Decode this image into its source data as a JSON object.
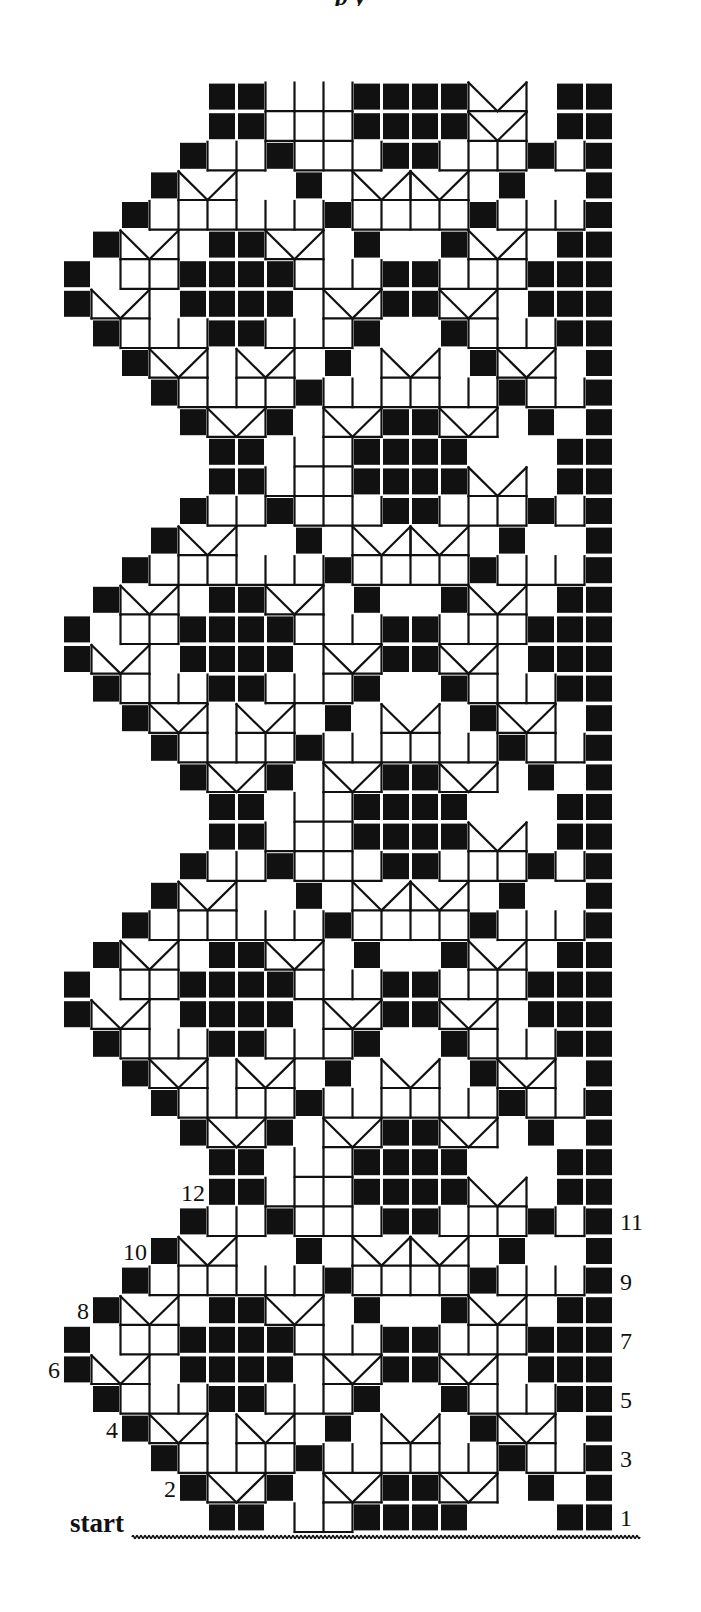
{
  "title_fragment": "p y",
  "chart": {
    "type": "filet-crochet-chart",
    "columns": 19,
    "rows": 49,
    "repeat_rows": 12,
    "colors": {
      "block": "#111111",
      "line": "#111111",
      "background": "#ffffff"
    },
    "motif": [
      {
        "row": 1,
        "blocks": [
          5,
          6,
          10,
          11,
          12,
          13,
          17,
          18
        ],
        "lacets": [],
        "bars": [
          [
            8,
            9
          ]
        ]
      },
      {
        "row": 2,
        "blocks": [
          4,
          7,
          11,
          12,
          16,
          18
        ],
        "lacets": [
          5,
          9,
          13
        ],
        "bars": []
      },
      {
        "row": 3,
        "blocks": [
          3,
          8,
          15,
          18
        ],
        "lacets": [],
        "bars": [
          [
            4,
            7
          ],
          [
            9,
            14
          ],
          [
            16,
            17
          ]
        ]
      },
      {
        "row": 4,
        "blocks": [
          2,
          9,
          14,
          18
        ],
        "lacets": [
          3,
          6,
          11,
          15
        ],
        "bars": []
      },
      {
        "row": 5,
        "blocks": [
          1,
          5,
          6,
          10,
          13,
          17,
          18
        ],
        "lacets": [],
        "bars": [
          [
            2,
            4
          ],
          [
            7,
            9
          ],
          [
            14,
            16
          ]
        ]
      },
      {
        "row": 6,
        "blocks": [
          0,
          4,
          5,
          6,
          7,
          11,
          12,
          16,
          17,
          18
        ],
        "lacets": [
          1,
          9,
          13
        ],
        "bars": []
      },
      {
        "row": 7,
        "blocks": [
          0,
          4,
          5,
          6,
          7,
          11,
          12,
          16,
          17,
          18
        ],
        "lacets": [],
        "bars": [
          [
            2,
            3
          ],
          [
            8,
            10
          ],
          [
            13,
            15
          ]
        ]
      },
      {
        "row": 8,
        "blocks": [
          1,
          5,
          6,
          10,
          13,
          17,
          18
        ],
        "lacets": [
          2,
          7,
          14
        ],
        "bars": []
      },
      {
        "row": 9,
        "blocks": [
          2,
          9,
          14,
          18
        ],
        "lacets": [],
        "bars": [
          [
            3,
            8
          ],
          [
            10,
            13
          ],
          [
            15,
            17
          ]
        ]
      },
      {
        "row": 10,
        "blocks": [
          3,
          8,
          15,
          18
        ],
        "lacets": [
          4,
          10,
          12
        ],
        "bars": []
      },
      {
        "row": 11,
        "blocks": [
          4,
          7,
          11,
          12,
          16,
          18
        ],
        "lacets": [],
        "bars": [
          [
            5,
            6
          ],
          [
            8,
            10
          ],
          [
            13,
            15
          ],
          [
            17,
            17
          ]
        ]
      },
      {
        "row": 12,
        "blocks": [
          5,
          6,
          10,
          11,
          12,
          13,
          17,
          18
        ],
        "lacets": [
          14
        ],
        "bars": [
          [
            7,
            9
          ]
        ]
      }
    ],
    "top_row": {
      "row": 49,
      "blocks": [
        5,
        6,
        10,
        11,
        12,
        13,
        17,
        18
      ],
      "bars": [
        [
          7,
          9
        ]
      ],
      "lacets": [
        14
      ]
    },
    "labels_right": [
      {
        "text": "1",
        "row": 1
      },
      {
        "text": "3",
        "row": 3
      },
      {
        "text": "5",
        "row": 5
      },
      {
        "text": "7",
        "row": 7
      },
      {
        "text": "9",
        "row": 9
      },
      {
        "text": "11",
        "row": 11
      }
    ],
    "labels_left": [
      {
        "text": "2",
        "row": 2
      },
      {
        "text": "4",
        "row": 4
      },
      {
        "text": "6",
        "row": 6
      },
      {
        "text": "8",
        "row": 8
      },
      {
        "text": "10",
        "row": 10
      },
      {
        "text": "12",
        "row": 12
      }
    ],
    "start_label": "start"
  }
}
